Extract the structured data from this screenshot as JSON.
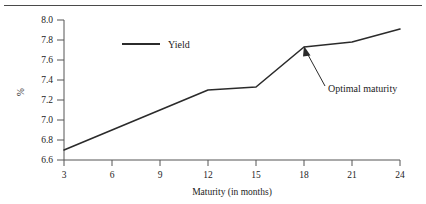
{
  "figure": {
    "background_color": "#ffffff",
    "line_color": "#2b2b2b",
    "axis_color": "#555555",
    "text_color": "#1c1c1c",
    "top_rule": "horizontal-rule"
  },
  "chart_data": {
    "type": "line",
    "title": "",
    "subtitle": "",
    "xlabel": "Maturity (in months)",
    "ylabel": "%",
    "x": [
      3,
      6,
      9,
      12,
      15,
      18,
      21,
      24
    ],
    "xtick_labels": [
      "3",
      "6",
      "9",
      "12",
      "15",
      "18",
      "21",
      "24"
    ],
    "ytick_labels": [
      "6.6",
      "6.8",
      "7.0",
      "7.2",
      "7.4",
      "7.6",
      "7.8",
      "8.0"
    ],
    "yticks": [
      6.6,
      6.8,
      7.0,
      7.2,
      7.4,
      7.6,
      7.8,
      8.0
    ],
    "xlim": [
      3,
      24
    ],
    "ylim": [
      6.6,
      8.0
    ],
    "grid": false,
    "legend_position": "upper-left-inside",
    "series": [
      {
        "name": "Yield",
        "values": [
          6.7,
          6.9,
          7.1,
          7.3,
          7.33,
          7.73,
          7.78,
          7.91
        ]
      }
    ],
    "annotations": [
      {
        "text": "Optimal maturity",
        "points_to_x": 18,
        "points_to_y": 7.73
      }
    ]
  },
  "legend": {
    "entries": [
      {
        "label": "Yield",
        "swatch": "line-swatch"
      }
    ]
  },
  "annotation": {
    "label": "Optimal maturity",
    "arrow": "arrow-icon"
  }
}
